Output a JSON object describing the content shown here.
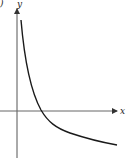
{
  "figure": {
    "partial_label": ")",
    "y_axis_label": "y",
    "x_axis_label": "x"
  },
  "colors": {
    "axis": "#555555",
    "curve": "#1a1a1a",
    "background": "#ffffff"
  }
}
